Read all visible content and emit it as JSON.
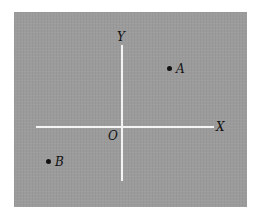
{
  "diagram": {
    "type": "coordinate-plane",
    "background_color": "#9b9b9b",
    "axis_color": "#f4f4f4",
    "axes": {
      "x_label": "X",
      "y_label": "Y",
      "origin_label": "O"
    },
    "points": [
      {
        "label": "A",
        "quadrant": "I"
      },
      {
        "label": "B",
        "quadrant": "III"
      }
    ]
  }
}
